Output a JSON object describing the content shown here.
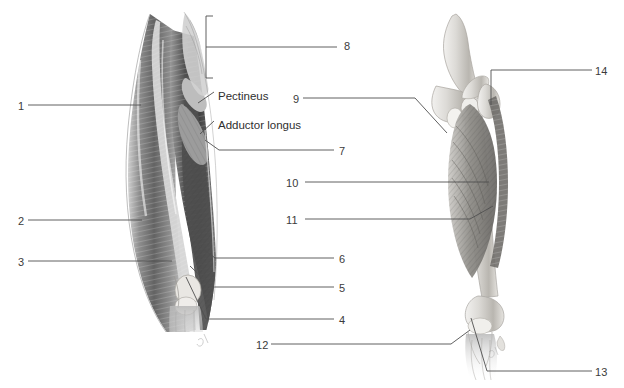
{
  "figure": {
    "background_color": "#ffffff",
    "ink_color": "#4a4a4a",
    "label_color": "#3b3b3b",
    "artist_mark": "gh"
  },
  "panels": [
    {
      "name": "superficial-anterior-thigh",
      "caption": "Left figure: superficial muscles of the anterior thigh"
    },
    {
      "name": "deep-hip-and-femur",
      "caption": "Right figure: deep hip muscles with femur and pelvis"
    }
  ],
  "numbered_labels": [
    {
      "id": "1",
      "text": "1",
      "x": 18,
      "y": 101,
      "side": "left"
    },
    {
      "id": "2",
      "text": "2",
      "x": 18,
      "y": 216,
      "side": "left"
    },
    {
      "id": "3",
      "text": "3",
      "x": 18,
      "y": 257,
      "side": "left"
    },
    {
      "id": "4",
      "text": "4",
      "x": 339,
      "y": 315,
      "side": "right"
    },
    {
      "id": "5",
      "text": "5",
      "x": 339,
      "y": 283,
      "side": "right"
    },
    {
      "id": "6",
      "text": "6",
      "x": 339,
      "y": 254,
      "side": "right"
    },
    {
      "id": "7",
      "text": "7",
      "x": 339,
      "y": 146,
      "side": "right"
    },
    {
      "id": "8",
      "text": "8",
      "x": 344,
      "y": 41,
      "side": "right"
    },
    {
      "id": "9",
      "text": "9",
      "x": 293,
      "y": 94,
      "side": "right"
    },
    {
      "id": "10",
      "text": "10",
      "x": 286,
      "y": 178,
      "side": "right"
    },
    {
      "id": "11",
      "text": "11",
      "x": 286,
      "y": 215,
      "side": "right"
    },
    {
      "id": "12",
      "text": "12",
      "x": 256,
      "y": 340,
      "side": "right"
    },
    {
      "id": "13",
      "text": "13",
      "x": 595,
      "y": 367,
      "side": "right"
    },
    {
      "id": "14",
      "text": "14",
      "x": 595,
      "y": 66,
      "side": "right"
    }
  ],
  "named_labels": [
    {
      "id": "pectineus",
      "text": "Pectineus",
      "x": 218,
      "y": 91
    },
    {
      "id": "adductor-longus",
      "text": "Adductor longus",
      "x": 218,
      "y": 120
    }
  ]
}
